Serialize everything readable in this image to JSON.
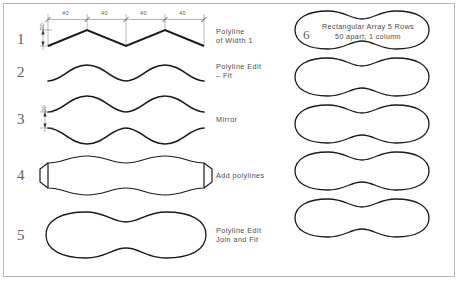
{
  "sheet": {
    "title": "Polyline Construction Exercise",
    "border_color": "#b9b9b9",
    "ink_color": "#1a1a1a",
    "dim_color": "#5a5a5a",
    "text_color": "#4a4a4a"
  },
  "dimensions": {
    "horizontal_label": "40",
    "horizontal_segments": [
      "40",
      "40",
      "40",
      "40"
    ],
    "vertical_label_top": "20",
    "vertical_label_step3": "20"
  },
  "steps": [
    {
      "number": "1",
      "label": "Polyline\nof Width 1",
      "label_line1": "Polyline",
      "label_line2": "of Width 1",
      "shape": "zigzag-polyline"
    },
    {
      "number": "2",
      "label": "Polyline Edit\n– Fit",
      "label_line1": "Polyline Edit",
      "label_line2": "– Fit",
      "shape": "fitted-wave"
    },
    {
      "number": "3",
      "label": "Mirror",
      "label_line1": "Mirror",
      "label_line2": "",
      "shape": "mirrored-waves"
    },
    {
      "number": "4",
      "label": "Add polylines",
      "label_line1": "Add polylines",
      "label_line2": "",
      "shape": "closed-polygon"
    },
    {
      "number": "5",
      "label": "Polyline Edit\nJoin and Fit",
      "label_line1": "Polyline Edit",
      "label_line2": "Join and Fit",
      "shape": "peanut-closed"
    }
  ],
  "array": {
    "number": "6",
    "note_line1": "Rectangular Array 5 Rows",
    "note_line2": "50 apart; 1 column",
    "note": "Rectangular Array 5 Rows\n50 apart; 1 column",
    "rows": 5,
    "columns": 1,
    "spacing": "50"
  }
}
